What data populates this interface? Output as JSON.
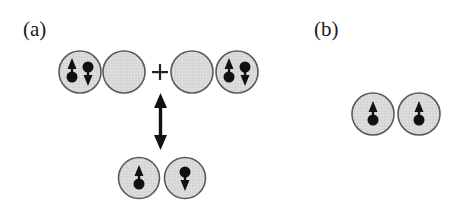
{
  "panels": {
    "a": {
      "label": "(a)",
      "operator": "+",
      "top_row": [
        {
          "id": "a-site-1",
          "electrons": [
            "up",
            "down"
          ]
        },
        {
          "id": "a-site-2",
          "electrons": []
        },
        {
          "id": "a-site-3",
          "electrons": []
        },
        {
          "id": "a-site-4",
          "electrons": [
            "up",
            "down"
          ]
        }
      ],
      "connector": "double-headed-vertical-arrow",
      "bottom_row": [
        {
          "id": "a-site-5",
          "electrons": [
            "up"
          ]
        },
        {
          "id": "a-site-6",
          "electrons": [
            "down"
          ]
        }
      ]
    },
    "b": {
      "label": "(b)",
      "row": [
        {
          "id": "b-site-1",
          "electrons": [
            "up"
          ]
        },
        {
          "id": "b-site-2",
          "electrons": [
            "up"
          ]
        }
      ]
    }
  },
  "colors": {
    "site_fill": "#d9d9d9",
    "site_stroke": "#5a5a5a",
    "electron": "#111111",
    "text": "#1a1a1a"
  }
}
